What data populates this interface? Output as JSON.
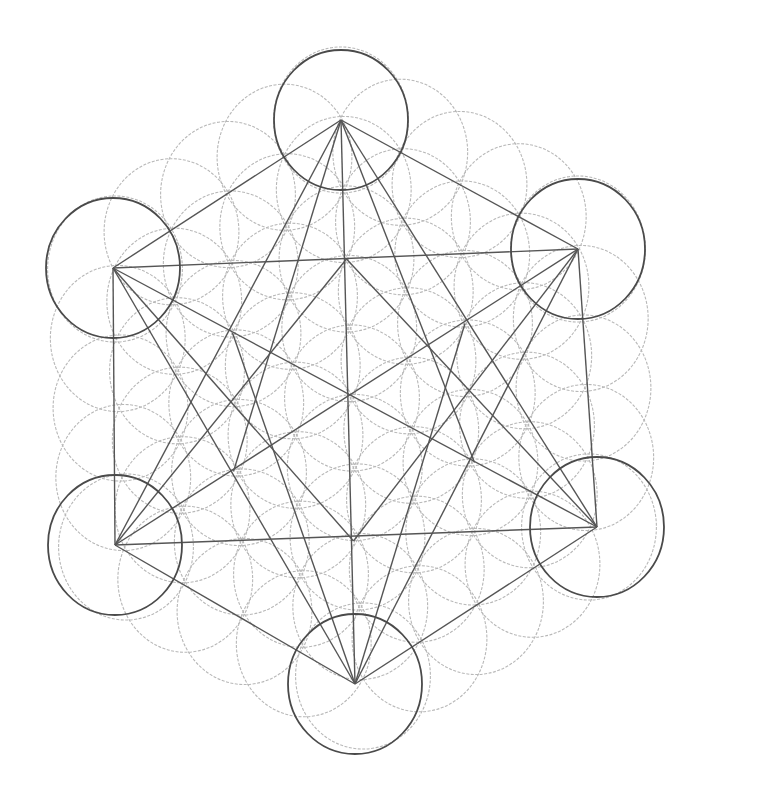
{
  "image": {
    "description": "Pencil drawing of Metatron's Cube over the Flower of Life",
    "background": "#ffffff",
    "stroke_dark": "#4a4a4a",
    "stroke_faint": "#b8b8b8"
  },
  "vertices": [
    {
      "name": "top",
      "x": 341,
      "y": 120
    },
    {
      "name": "upper-left",
      "x": 113,
      "y": 268
    },
    {
      "name": "upper-right",
      "x": 578,
      "y": 249
    },
    {
      "name": "lower-left",
      "x": 115,
      "y": 545
    },
    {
      "name": "lower-right",
      "x": 597,
      "y": 527
    },
    {
      "name": "bottom",
      "x": 355,
      "y": 684
    },
    {
      "name": "center",
      "x": 352,
      "y": 398
    }
  ]
}
